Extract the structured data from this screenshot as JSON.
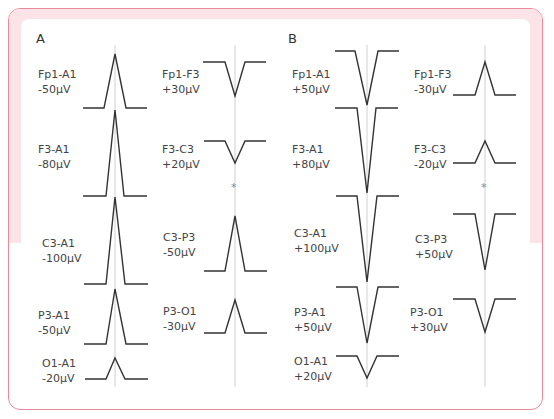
{
  "figure": {
    "colors": {
      "border": "#e8899c",
      "band": "#fbe3e8",
      "trace": "#333333",
      "guide": "#bbbbbb"
    },
    "panels": [
      {
        "label": "A",
        "columns": [
          {
            "guide_x": 115,
            "traces": [
              {
                "lead": "Fp1-A1",
                "value": "-50μV",
                "label_x": 30,
                "label_y": 60
              },
              {
                "lead": "F3-A1",
                "value": "-80μV",
                "label_x": 30,
                "label_y": 146
              },
              {
                "lead": "C3-A1",
                "value": "-100μV",
                "label_x": 30,
                "label_y": 231
              },
              {
                "lead": "P3-A1",
                "value": "-50μV",
                "label_x": 30,
                "label_y": 305
              },
              {
                "lead": "O1-A1",
                "value": "-20μV",
                "label_x": 30,
                "label_y": 355
              }
            ]
          },
          {
            "guide_x": 235,
            "traces": [
              {
                "lead": "Fp1-F3",
                "value": "+30μV",
                "label_x": 152,
                "label_y": 60
              },
              {
                "lead": "F3-C3",
                "value": "+20μV",
                "label_x": 152,
                "label_y": 140
              },
              {
                "lead": "C3-P3",
                "value": "-50μV",
                "label_x": 152,
                "label_y": 230
              },
              {
                "lead": "P3-O1",
                "value": "-30μV",
                "label_x": 152,
                "label_y": 300
              }
            ],
            "marker": "*"
          }
        ]
      },
      {
        "label": "B",
        "columns": [
          {
            "guide_x": 367,
            "traces": [
              {
                "lead": "Fp1-A1",
                "value": "+50μV",
                "label_x": 292,
                "label_y": 60
              },
              {
                "lead": "F3-A1",
                "value": "+80μV",
                "label_x": 292,
                "label_y": 139
              },
              {
                "lead": "C3-A1",
                "value": "+100μV",
                "label_x": 292,
                "label_y": 228
              },
              {
                "lead": "P3-A1",
                "value": "+50μV",
                "label_x": 292,
                "label_y": 304
              },
              {
                "lead": "O1-A1",
                "value": "+20μV",
                "label_x": 292,
                "label_y": 355
              }
            ]
          },
          {
            "guide_x": 485,
            "traces": [
              {
                "lead": "Fp1-F3",
                "value": "-30μV",
                "label_x": 412,
                "label_y": 66
              },
              {
                "lead": "F3-C3",
                "value": "-20μV",
                "label_x": 412,
                "label_y": 140
              },
              {
                "lead": "C3-P3",
                "value": "+50μV",
                "label_x": 412,
                "label_y": 231
              },
              {
                "lead": "P3-O1",
                "value": "+30μV",
                "label_x": 409,
                "label_y": 302
              }
            ],
            "marker": "*"
          }
        ]
      }
    ]
  }
}
